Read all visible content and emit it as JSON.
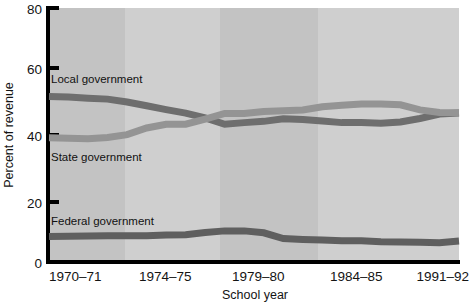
{
  "chart_data": {
    "type": "line",
    "title": "",
    "xlabel": "School year",
    "ylabel": "Percent of revenue",
    "ylim": [
      0,
      80
    ],
    "yticks": [
      0,
      20,
      40,
      60,
      80
    ],
    "ytick_labels": [
      "0",
      "20",
      "40",
      "60",
      "80"
    ],
    "xlim": [
      1970,
      1991
    ],
    "xticks": [
      1970,
      1974,
      1979,
      1984,
      1991
    ],
    "xtick_labels": [
      "1970–71",
      "1974–75",
      "1979–80",
      "1984–85",
      "1991–92"
    ],
    "grid": false,
    "legend_position": "inline-labels",
    "plot_background_bands": [
      {
        "from": 1970,
        "to": 1974,
        "color": "#c3c3c3"
      },
      {
        "from": 1974,
        "to": 1979,
        "color": "#cfcfcf"
      },
      {
        "from": 1979,
        "to": 1984,
        "color": "#c3c3c3"
      },
      {
        "from": 1984,
        "to": 1991,
        "color": "#cfcfcf"
      }
    ],
    "x": [
      1970,
      1971,
      1972,
      1973,
      1974,
      1975,
      1976,
      1977,
      1978,
      1979,
      1980,
      1981,
      1982,
      1983,
      1984,
      1985,
      1986,
      1987,
      1988,
      1989,
      1990,
      1991
    ],
    "series": [
      {
        "name": "Local government",
        "label": "Local government",
        "color": "#6e6e6e",
        "line_width": 7,
        "values": [
          52.1,
          52.0,
          51.6,
          51.3,
          50.4,
          49.2,
          48.0,
          46.9,
          45.4,
          43.4,
          43.9,
          44.3,
          45.1,
          44.9,
          44.4,
          43.9,
          43.9,
          43.7,
          44.1,
          45.2,
          46.6,
          46.9
        ]
      },
      {
        "name": "State government",
        "label": "State government",
        "color": "#949494",
        "line_width": 7,
        "values": [
          39.1,
          39.0,
          38.8,
          39.2,
          40.1,
          42.2,
          43.4,
          43.4,
          45.0,
          46.8,
          46.8,
          47.4,
          47.6,
          47.9,
          48.9,
          49.4,
          49.8,
          49.8,
          49.5,
          47.9,
          47.1,
          47.0
        ]
      },
      {
        "name": "Federal government",
        "label": "Federal government",
        "color": "#5f5f5f",
        "line_width": 7,
        "values": [
          8.0,
          8.1,
          8.2,
          8.3,
          8.3,
          8.3,
          8.5,
          8.6,
          9.3,
          9.8,
          9.8,
          9.2,
          7.4,
          7.1,
          6.9,
          6.7,
          6.7,
          6.4,
          6.3,
          6.2,
          6.1,
          6.6
        ]
      }
    ],
    "series_label_positions": [
      {
        "series": "Local government",
        "x_px": 51,
        "y_px": 83
      },
      {
        "series": "State government",
        "x_px": 51,
        "y_px": 161
      },
      {
        "series": "Federal government",
        "x_px": 51,
        "y_px": 225
      }
    ],
    "axis_color": "#000000"
  }
}
